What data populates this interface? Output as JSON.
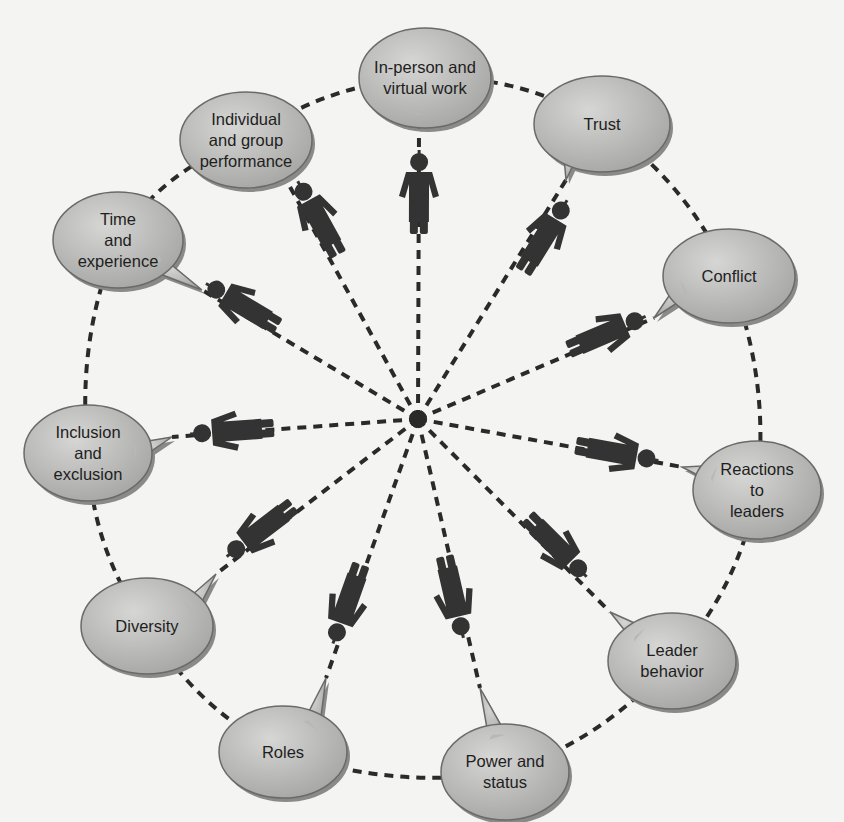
{
  "diagram": {
    "type": "hub-and-spoke speech-bubble diagram",
    "center_node": {
      "x": 418,
      "y": 419
    },
    "colors": {
      "background": "#f4f4f2",
      "bubble_fill_light": "#d2d2d0",
      "bubble_fill_dark": "#a8a8a6",
      "bubble_stroke": "#6a6a68",
      "dash_line": "#2a2a2a",
      "figure": "#333333",
      "text": "#1e1e1e"
    },
    "bubbles": [
      {
        "id": "in-person-virtual-work",
        "label": "In-person and\nvirtual work",
        "cx": 425,
        "cy": 78,
        "rx": 66,
        "ry": 50,
        "tail": [
          419,
          128
        ]
      },
      {
        "id": "trust",
        "label": "Trust",
        "cx": 602,
        "cy": 124,
        "rx": 68,
        "ry": 48,
        "tail": [
          566,
          180
        ]
      },
      {
        "id": "conflict",
        "label": "Conflict",
        "cx": 729,
        "cy": 276,
        "rx": 66,
        "ry": 47,
        "tail": [
          654,
          318
        ]
      },
      {
        "id": "reactions-to-leaders",
        "label": "Reactions\nto\nleaders",
        "cx": 757,
        "cy": 490,
        "rx": 64,
        "ry": 49,
        "tail": [
          682,
          467
        ]
      },
      {
        "id": "leader-behavior",
        "label": "Leader\nbehavior",
        "cx": 672,
        "cy": 661,
        "rx": 64,
        "ry": 48,
        "tail": [
          610,
          612
        ]
      },
      {
        "id": "power-and-status",
        "label": "Power and\nstatus",
        "cx": 505,
        "cy": 772,
        "rx": 64,
        "ry": 48,
        "tail": [
          480,
          688
        ]
      },
      {
        "id": "roles",
        "label": "Roles",
        "cx": 283,
        "cy": 752,
        "rx": 64,
        "ry": 46,
        "tail": [
          326,
          678
        ]
      },
      {
        "id": "diversity",
        "label": "Diversity",
        "cx": 147,
        "cy": 626,
        "rx": 66,
        "ry": 48,
        "tail": [
          216,
          574
        ]
      },
      {
        "id": "inclusion-and-exclusion",
        "label": "Inclusion\nand\nexclusion",
        "cx": 88,
        "cy": 453,
        "rx": 64,
        "ry": 48,
        "tail": [
          172,
          437
        ]
      },
      {
        "id": "time-and-experience",
        "label": "Time\nand\nexperience",
        "cx": 118,
        "cy": 240,
        "rx": 65,
        "ry": 48,
        "tail": [
          202,
          290
        ]
      },
      {
        "id": "individual-and-group-performance",
        "label": "Individual\nand group\nperformance",
        "cx": 246,
        "cy": 140,
        "rx": 66,
        "ry": 48,
        "tail": [
          284,
          176
        ]
      }
    ],
    "figures": [
      {
        "for": "in-person-virtual-work",
        "x": 419,
        "y": 192
      },
      {
        "for": "trust",
        "x": 545,
        "y": 236
      },
      {
        "for": "conflict",
        "x": 607,
        "y": 333
      },
      {
        "for": "reactions-to-leaders",
        "x": 617,
        "y": 453
      },
      {
        "for": "leader-behavior",
        "x": 557,
        "y": 547
      },
      {
        "for": "power-and-status",
        "x": 454,
        "y": 597
      },
      {
        "for": "roles",
        "x": 347,
        "y": 604
      },
      {
        "for": "diversity",
        "x": 260,
        "y": 531
      },
      {
        "for": "inclusion-and-exclusion",
        "x": 232,
        "y": 431
      },
      {
        "for": "time-and-experience",
        "x": 242,
        "y": 305
      },
      {
        "for": "individual-and-group-performance",
        "x": 318,
        "y": 218
      }
    ],
    "outer_ring_order": [
      "in-person-virtual-work",
      "trust",
      "conflict",
      "reactions-to-leaders",
      "leader-behavior",
      "power-and-status",
      "roles",
      "diversity",
      "inclusion-and-exclusion",
      "time-and-experience",
      "individual-and-group-performance"
    ]
  }
}
